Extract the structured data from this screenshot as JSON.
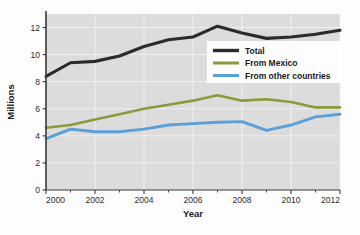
{
  "chart_data": {
    "type": "line",
    "title": "",
    "xlabel": "Year",
    "ylabel": "Millions",
    "xlim": [
      2000,
      2012
    ],
    "ylim": [
      0,
      13
    ],
    "grid": true,
    "legend_position": "inside-right-upper",
    "x": [
      2000,
      2001,
      2002,
      2003,
      2004,
      2005,
      2006,
      2007,
      2008,
      2009,
      2010,
      2011,
      2012
    ],
    "xticks": [
      2000,
      2002,
      2004,
      2006,
      2008,
      2010,
      2012
    ],
    "xtick_labels": [
      "2000",
      "2002",
      "2004",
      "2006",
      "2008",
      "2010",
      "2012"
    ],
    "xminor_ticks": [
      2001,
      2003,
      2005,
      2007,
      2009,
      2011
    ],
    "yticks": [
      0,
      2,
      4,
      6,
      8,
      10,
      12
    ],
    "ytick_labels": [
      "0",
      "2",
      "4",
      "6",
      "8",
      "10",
      "12"
    ],
    "series": [
      {
        "name": "Total",
        "color": "#2b2b2b",
        "width": 3.1,
        "values": [
          8.4,
          9.4,
          9.5,
          9.9,
          10.6,
          11.1,
          11.3,
          12.1,
          11.6,
          11.2,
          11.3,
          11.5,
          11.8
        ]
      },
      {
        "name": "From Mexico",
        "color": "#8a9a3c",
        "width": 2.6,
        "values": [
          4.6,
          4.8,
          5.2,
          5.6,
          6.0,
          6.3,
          6.6,
          7.0,
          6.6,
          6.7,
          6.5,
          6.1,
          6.1
        ]
      },
      {
        "name": "From other countries",
        "color": "#5a9fd8",
        "width": 2.9,
        "values": [
          3.8,
          4.5,
          4.3,
          4.3,
          4.5,
          4.8,
          4.9,
          5.0,
          5.05,
          4.4,
          4.8,
          5.4,
          5.6
        ]
      }
    ]
  },
  "legend": {
    "entries": [
      {
        "label": "Total",
        "color": "#2b2b2b"
      },
      {
        "label": "From Mexico",
        "color": "#8a9a3c"
      },
      {
        "label": "From other countries",
        "color": "#5a9fd8"
      }
    ]
  },
  "axes": {
    "y_title": "Millions",
    "x_title": "Year"
  },
  "style": {
    "plot_background": "#dcdcdc",
    "gridline_color": "#f2f2f2",
    "axis_color": "#3a3a3a",
    "page_background": "#fdfdfd"
  }
}
